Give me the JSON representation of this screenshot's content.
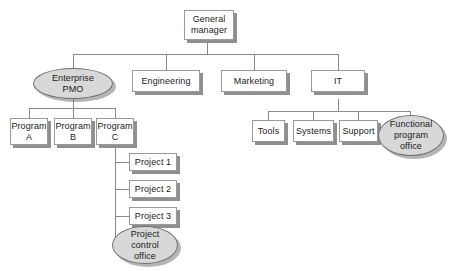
{
  "diagram": {
    "type": "organizational-chart",
    "background_color": "#ffffff",
    "box_fill": "#ffffff",
    "box_border": "#9a9a9a",
    "ellipse_fill": "#d8d8d8",
    "ellipse_border": "#6f6f6f",
    "line_color": "#8a8a8a",
    "shadow_color": "#8f8f8f"
  },
  "nodes": {
    "general_manager": {
      "label": "General\nmanager",
      "shape": "rect"
    },
    "enterprise_pmo": {
      "label": "Enterprise\nPMO",
      "shape": "ellipse"
    },
    "engineering": {
      "label": "Engineering",
      "shape": "rect"
    },
    "marketing": {
      "label": "Marketing",
      "shape": "rect"
    },
    "it": {
      "label": "IT",
      "shape": "rect"
    },
    "program_a": {
      "label": "Program\nA",
      "shape": "rect"
    },
    "program_b": {
      "label": "Program\nB",
      "shape": "rect"
    },
    "program_c": {
      "label": "Program\nC",
      "shape": "rect"
    },
    "tools": {
      "label": "Tools",
      "shape": "rect"
    },
    "systems": {
      "label": "Systems",
      "shape": "rect"
    },
    "support": {
      "label": "Support",
      "shape": "rect"
    },
    "functional_program_office": {
      "label": "Functional\nprogram\noffice",
      "shape": "ellipse"
    },
    "project_1": {
      "label": "Project 1",
      "shape": "rect"
    },
    "project_2": {
      "label": "Project 2",
      "shape": "rect"
    },
    "project_3": {
      "label": "Project 3",
      "shape": "rect"
    },
    "project_control_office": {
      "label": "Project\ncontrol\noffice",
      "shape": "ellipse"
    }
  },
  "hierarchy": {
    "root": "general_manager",
    "edges": [
      [
        "general_manager",
        "enterprise_pmo"
      ],
      [
        "general_manager",
        "engineering"
      ],
      [
        "general_manager",
        "marketing"
      ],
      [
        "general_manager",
        "it"
      ],
      [
        "enterprise_pmo",
        "program_a"
      ],
      [
        "enterprise_pmo",
        "program_b"
      ],
      [
        "enterprise_pmo",
        "program_c"
      ],
      [
        "it",
        "tools"
      ],
      [
        "it",
        "systems"
      ],
      [
        "it",
        "support"
      ],
      [
        "it",
        "functional_program_office"
      ],
      [
        "program_c",
        "project_1"
      ],
      [
        "program_c",
        "project_2"
      ],
      [
        "program_c",
        "project_3"
      ],
      [
        "program_c",
        "project_control_office"
      ]
    ]
  }
}
